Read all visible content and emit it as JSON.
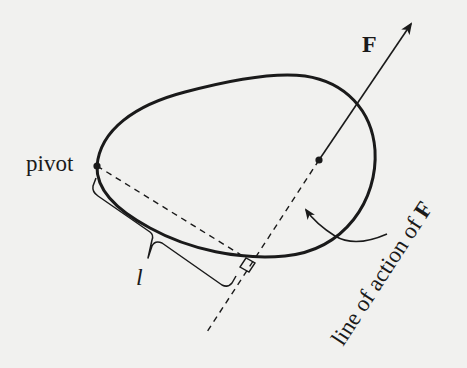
{
  "diagram": {
    "labels": {
      "pivot": "pivot",
      "force": "F",
      "lever_arm": "l",
      "line_of_action_prefix": "line of action of ",
      "line_of_action_force": "F"
    },
    "colors": {
      "ink": "#1a1a1a",
      "background": "#f1f1ef"
    },
    "elements": [
      {
        "id": "rigid-body",
        "type": "closed-curve",
        "description": "egg-shaped rigid body outline"
      },
      {
        "id": "pivot-point",
        "type": "dot",
        "x": 97,
        "y": 166
      },
      {
        "id": "application-point",
        "type": "dot",
        "x": 319,
        "y": 160
      },
      {
        "id": "force-vector",
        "type": "arrow",
        "from": [
          319,
          160
        ],
        "to": [
          412,
          23
        ]
      },
      {
        "id": "line-of-action",
        "type": "dashed-line",
        "from": [
          319,
          160
        ],
        "to": [
          205,
          335
        ]
      },
      {
        "id": "perpendicular",
        "type": "dashed-line",
        "from": [
          97,
          166
        ],
        "to": [
          246,
          258
        ]
      },
      {
        "id": "right-angle-marker",
        "type": "square",
        "at": [
          246,
          258
        ]
      },
      {
        "id": "lever-arm-brace",
        "type": "brace",
        "label": "l"
      },
      {
        "id": "pointer-arrow",
        "type": "curved-arrow",
        "points_to": "line-of-action"
      }
    ]
  }
}
